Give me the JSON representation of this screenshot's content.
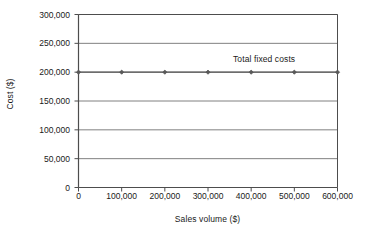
{
  "chart_data": {
    "type": "line",
    "title": "",
    "subtitle": "",
    "xlabel": "Sales volume ($)",
    "ylabel": "Cost ($)",
    "xlim": [
      0,
      600000
    ],
    "ylim": [
      0,
      300000
    ],
    "x_ticks": [
      0,
      100000,
      200000,
      300000,
      400000,
      500000,
      600000
    ],
    "x_tick_labels": [
      "0",
      "100,000",
      "200,000",
      "300,000",
      "400,000",
      "500,000",
      "600,000"
    ],
    "y_ticks": [
      0,
      50000,
      100000,
      150000,
      200000,
      250000,
      300000
    ],
    "y_tick_labels": [
      "0",
      "50,000",
      "100,000",
      "150,000",
      "200,000",
      "250,000",
      "300,000"
    ],
    "grid": {
      "horizontal": true,
      "vertical": false,
      "color": "#808080"
    },
    "legend": {
      "visible": false,
      "position": "none"
    },
    "annotations": [
      {
        "text": "Total fixed costs",
        "x": 430000,
        "y": 222000
      }
    ],
    "series": [
      {
        "name": "Total fixed costs",
        "marker": "diamond",
        "color": "#595959",
        "x": [
          0,
          100000,
          200000,
          300000,
          400000,
          500000,
          600000
        ],
        "values": [
          200000,
          200000,
          200000,
          200000,
          200000,
          200000,
          200000
        ]
      }
    ],
    "colors": {
      "axis": "#4d4d4d",
      "grid": "#808080",
      "series": "#595959",
      "text": "#1a1a1a",
      "background": "#ffffff"
    }
  }
}
